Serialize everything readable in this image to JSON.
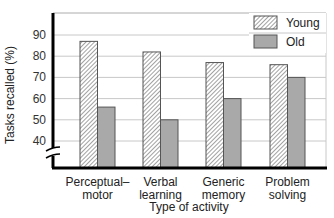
{
  "chart_data": {
    "type": "bar",
    "title": "",
    "xlabel": "Type of activity",
    "ylabel": "Tasks recalled (%)",
    "categories": [
      "Perceptual–motor",
      "Verbal learning",
      "Generic memory",
      "Problem solving"
    ],
    "category_lines": [
      [
        "Perceptual–",
        "motor"
      ],
      [
        "Verbal",
        "learning"
      ],
      [
        "Generic",
        "memory"
      ],
      [
        "Problem",
        "solving"
      ]
    ],
    "series": [
      {
        "name": "Young",
        "pattern": "hatched",
        "values": [
          87,
          82,
          77,
          76
        ]
      },
      {
        "name": "Old",
        "pattern": "solid-gray",
        "values": [
          56,
          50,
          60,
          70
        ]
      }
    ],
    "yticks": [
      40,
      50,
      60,
      70,
      80,
      90
    ],
    "ylim": [
      30,
      95
    ],
    "axis_break": true,
    "grid": true,
    "legend_position": "top-right",
    "colors": {
      "young_fill": "#ffffff",
      "young_hatch": "#555555",
      "old_fill": "#a9a9a9",
      "grid": "#c8c8c8",
      "axis": "#000000"
    }
  },
  "legend": {
    "items": [
      {
        "label": "Young"
      },
      {
        "label": "Old"
      }
    ]
  }
}
